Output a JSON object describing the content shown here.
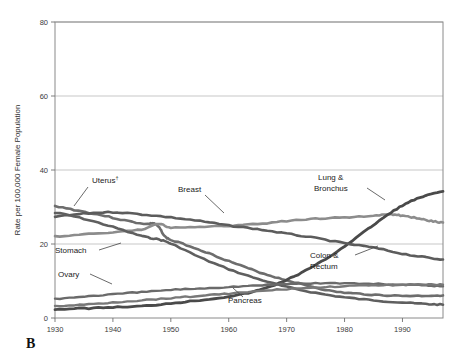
{
  "panel": {
    "label": "B"
  },
  "chart_data": {
    "type": "line",
    "title": "",
    "xlabel": "",
    "ylabel": "Rate per 100,000 Female Population",
    "xlim": [
      1930,
      1997
    ],
    "ylim": [
      0,
      80
    ],
    "xticks": [
      1930,
      1940,
      1950,
      1960,
      1970,
      1980,
      1990
    ],
    "xticklabels": [
      "1930",
      "1940",
      "1950",
      "1960",
      "1970",
      "1980",
      "1990"
    ],
    "yticks": [
      0,
      20,
      40,
      60,
      80
    ],
    "yticklabels": [
      "0",
      "20",
      "40",
      "60",
      "80"
    ],
    "grid": "horizontal",
    "legend": "inline-annotations",
    "series": [
      {
        "name": "Uterus",
        "label": "Uterus",
        "label_superscript": "†",
        "color": "#6d6d6d",
        "width": 2.6,
        "x": [
          1930,
          1934,
          1938,
          1942,
          1946,
          1947,
          1948,
          1949,
          1950,
          1954,
          1958,
          1962,
          1966,
          1970,
          1974,
          1978,
          1982,
          1986,
          1990,
          1994,
          1997
        ],
        "y": [
          30.2,
          29.0,
          27.8,
          26.4,
          25.4,
          25.6,
          24.4,
          22.0,
          21.0,
          19.0,
          16.6,
          14.2,
          12.0,
          10.2,
          8.6,
          7.2,
          6.6,
          6.2,
          6.0,
          6.0,
          6.1
        ]
      },
      {
        "name": "Breast",
        "label": "Breast",
        "color": "#8c8c8c",
        "width": 2.6,
        "x": [
          1930,
          1935,
          1940,
          1945,
          1948,
          1950,
          1955,
          1960,
          1965,
          1970,
          1975,
          1980,
          1985,
          1988,
          1990,
          1993,
          1995,
          1997
        ],
        "y": [
          22.0,
          22.6,
          23.2,
          23.9,
          25.4,
          24.4,
          24.6,
          24.9,
          25.4,
          26.2,
          26.8,
          27.2,
          27.6,
          28.0,
          27.6,
          26.9,
          26.2,
          25.8
        ]
      },
      {
        "name": "Lung & Bronchus",
        "label": "Lung &\nBronchus",
        "label_lines": [
          "Lung &",
          "Bronchus"
        ],
        "color": "#4a4a4a",
        "width": 2.8,
        "x": [
          1930,
          1935,
          1940,
          1945,
          1950,
          1955,
          1960,
          1964,
          1968,
          1972,
          1976,
          1980,
          1984,
          1988,
          1991,
          1994,
          1997
        ],
        "y": [
          2.4,
          2.6,
          2.9,
          3.2,
          4.0,
          4.8,
          5.8,
          7.0,
          9.0,
          11.8,
          15.2,
          19.4,
          24.0,
          28.4,
          31.2,
          33.0,
          34.2
        ]
      },
      {
        "name": "Colon & Rectum",
        "label": "Colon &\nRectum",
        "label_lines": [
          "Colon &",
          "Rectum"
        ],
        "color": "#5c5c5c",
        "width": 2.6,
        "x": [
          1930,
          1935,
          1940,
          1945,
          1950,
          1955,
          1960,
          1965,
          1970,
          1975,
          1980,
          1985,
          1990,
          1994,
          1997
        ],
        "y": [
          27.4,
          28.2,
          28.6,
          28.0,
          27.2,
          26.2,
          25.0,
          24.0,
          22.8,
          21.6,
          20.2,
          19.0,
          17.4,
          16.4,
          15.8
        ]
      },
      {
        "name": "Stomach",
        "label": "Stomach",
        "color": "#5f5f5f",
        "width": 2.6,
        "x": [
          1930,
          1935,
          1940,
          1945,
          1948,
          1950,
          1955,
          1960,
          1965,
          1970,
          1975,
          1980,
          1985,
          1990,
          1994,
          1997
        ],
        "y": [
          28.4,
          26.8,
          24.6,
          22.2,
          21.2,
          20.0,
          16.4,
          13.2,
          10.6,
          8.4,
          6.8,
          5.6,
          4.8,
          4.2,
          3.8,
          3.6
        ]
      },
      {
        "name": "Ovary",
        "label": "Ovary",
        "color": "#6a6a6a",
        "width": 2.4,
        "x": [
          1930,
          1935,
          1940,
          1945,
          1950,
          1955,
          1960,
          1965,
          1970,
          1975,
          1980,
          1985,
          1990,
          1994,
          1997
        ],
        "y": [
          5.2,
          5.8,
          6.4,
          7.0,
          7.6,
          8.0,
          8.4,
          8.8,
          9.2,
          9.4,
          9.4,
          9.2,
          9.0,
          8.8,
          8.6
        ]
      },
      {
        "name": "Pancreas",
        "label": "Pancreas",
        "color": "#787878",
        "width": 2.4,
        "x": [
          1930,
          1935,
          1940,
          1945,
          1950,
          1955,
          1960,
          1965,
          1970,
          1975,
          1980,
          1985,
          1990,
          1994,
          1997
        ],
        "y": [
          3.2,
          3.6,
          4.2,
          4.8,
          5.4,
          6.0,
          6.6,
          7.2,
          7.8,
          8.2,
          8.6,
          8.8,
          9.0,
          9.0,
          9.0
        ]
      }
    ],
    "annotations": [
      {
        "name": "uterus-label",
        "text": "Uterus",
        "superscript": "†",
        "x": 92,
        "y": 183,
        "leader": [
          88,
          187,
          74,
          206
        ]
      },
      {
        "name": "breast-label",
        "text": "Breast",
        "x": 178,
        "y": 192,
        "leader": [
          205,
          195,
          224,
          213
        ]
      },
      {
        "name": "lung-label-1",
        "text": "Lung &",
        "x": 318,
        "y": 180
      },
      {
        "name": "lung-label-2",
        "text": "Bronchus",
        "x": 314,
        "y": 191,
        "leader": [
          367,
          188,
          385,
          200
        ]
      },
      {
        "name": "colon-label-1",
        "text": "Colon &",
        "x": 310,
        "y": 258,
        "leader": [
          355,
          255,
          378,
          246
        ]
      },
      {
        "name": "colon-label-2",
        "text": "Rectum",
        "x": 310,
        "y": 269
      },
      {
        "name": "stomach-label",
        "text": "Stomach",
        "x": 55,
        "y": 253,
        "leader": [
          99,
          250,
          121,
          243
        ]
      },
      {
        "name": "ovary-label",
        "text": "Ovary",
        "x": 58,
        "y": 277,
        "leader": [
          90,
          274,
          112,
          284
        ]
      },
      {
        "name": "pancreas-label",
        "text": "Pancreas",
        "x": 228,
        "y": 303,
        "leader": [
          243,
          297,
          233,
          288
        ]
      }
    ]
  }
}
